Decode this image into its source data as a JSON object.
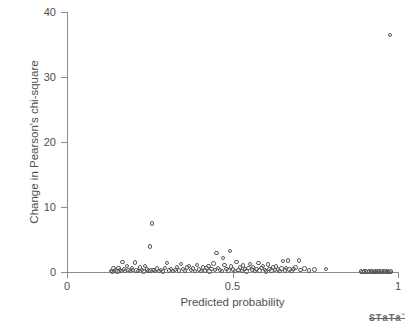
{
  "chart_data": {
    "type": "scatter",
    "title": "",
    "xlabel": "Predicted probability",
    "ylabel": "Change in Pearson's chi-square",
    "xlim": [
      0,
      1
    ],
    "ylim": [
      0,
      40
    ],
    "xticks": [
      "0",
      "0.5",
      "1"
    ],
    "xtick_values": [
      0,
      0.5,
      1
    ],
    "yticks": [
      "0",
      "10",
      "20",
      "30",
      "40"
    ],
    "ytick_values": [
      0,
      10,
      20,
      30,
      40
    ],
    "grid": false,
    "legend": null,
    "marker": "open-circle",
    "marker_color": "#5a5a5a",
    "series": [
      {
        "name": "observations",
        "points": [
          [
            0.132,
            0.18
          ],
          [
            0.137,
            0.1
          ],
          [
            0.141,
            0.55
          ],
          [
            0.146,
            0.22
          ],
          [
            0.152,
            0.08
          ],
          [
            0.156,
            0.62
          ],
          [
            0.16,
            0.3
          ],
          [
            0.163,
            0.12
          ],
          [
            0.168,
            1.55
          ],
          [
            0.172,
            0.45
          ],
          [
            0.176,
            0.2
          ],
          [
            0.181,
            0.9
          ],
          [
            0.186,
            0.28
          ],
          [
            0.191,
            0.12
          ],
          [
            0.196,
            0.58
          ],
          [
            0.2,
            0.35
          ],
          [
            0.205,
            1.45
          ],
          [
            0.21,
            0.22
          ],
          [
            0.215,
            0.15
          ],
          [
            0.22,
            0.72
          ],
          [
            0.226,
            0.3
          ],
          [
            0.231,
            0.1
          ],
          [
            0.236,
            0.95
          ],
          [
            0.241,
            0.4
          ],
          [
            0.246,
            0.18
          ],
          [
            0.25,
            3.95
          ],
          [
            0.252,
            0.25
          ],
          [
            0.256,
            7.45
          ],
          [
            0.261,
            0.32
          ],
          [
            0.266,
            0.12
          ],
          [
            0.272,
            0.55
          ],
          [
            0.278,
            0.2
          ],
          [
            0.284,
            0.28
          ],
          [
            0.29,
            0.1
          ],
          [
            0.296,
            0.62
          ],
          [
            0.302,
            1.35
          ],
          [
            0.308,
            0.22
          ],
          [
            0.314,
            0.48
          ],
          [
            0.32,
            0.18
          ],
          [
            0.326,
            0.35
          ],
          [
            0.332,
            0.8
          ],
          [
            0.338,
            0.25
          ],
          [
            0.344,
            1.2
          ],
          [
            0.35,
            0.42
          ],
          [
            0.356,
            0.15
          ],
          [
            0.362,
            0.68
          ],
          [
            0.368,
            0.95
          ],
          [
            0.374,
            0.3
          ],
          [
            0.38,
            0.55
          ],
          [
            0.386,
            0.2
          ],
          [
            0.392,
            1.05
          ],
          [
            0.398,
            0.38
          ],
          [
            0.404,
            0.12
          ],
          [
            0.41,
            0.72
          ],
          [
            0.416,
            0.25
          ],
          [
            0.422,
            0.6
          ],
          [
            0.428,
            0.9
          ],
          [
            0.43,
            0.05
          ],
          [
            0.436,
            0.45
          ],
          [
            0.442,
            1.3
          ],
          [
            0.448,
            0.28
          ],
          [
            0.452,
            2.95
          ],
          [
            0.456,
            0.65
          ],
          [
            0.462,
            0.35
          ],
          [
            0.468,
            0.18
          ],
          [
            0.472,
            2.15
          ],
          [
            0.476,
            1.1
          ],
          [
            0.482,
            0.5
          ],
          [
            0.488,
            0.22
          ],
          [
            0.492,
            3.2
          ],
          [
            0.496,
            0.82
          ],
          [
            0.502,
            0.4
          ],
          [
            0.508,
            0.12
          ],
          [
            0.512,
            1.55
          ],
          [
            0.518,
            0.3
          ],
          [
            0.522,
            0.68
          ],
          [
            0.528,
            0.2
          ],
          [
            0.532,
            1.0
          ],
          [
            0.538,
            0.45
          ],
          [
            0.542,
            0.08
          ],
          [
            0.548,
            0.58
          ],
          [
            0.552,
            1.25
          ],
          [
            0.558,
            0.32
          ],
          [
            0.562,
            0.75
          ],
          [
            0.568,
            0.15
          ],
          [
            0.572,
            0.5
          ],
          [
            0.578,
            1.42
          ],
          [
            0.582,
            0.26
          ],
          [
            0.588,
            0.62
          ],
          [
            0.592,
            0.95
          ],
          [
            0.598,
            0.35
          ],
          [
            0.602,
            0.1
          ],
          [
            0.608,
            1.18
          ],
          [
            0.612,
            0.48
          ],
          [
            0.618,
            0.22
          ],
          [
            0.622,
            0.7
          ],
          [
            0.628,
            0.3
          ],
          [
            0.632,
            0.85
          ],
          [
            0.638,
            0.4
          ],
          [
            0.642,
            0.14
          ],
          [
            0.648,
            0.55
          ],
          [
            0.652,
            1.72
          ],
          [
            0.658,
            0.25
          ],
          [
            0.662,
            0.62
          ],
          [
            0.668,
            1.8
          ],
          [
            0.672,
            0.38
          ],
          [
            0.678,
            0.18
          ],
          [
            0.684,
            0.45
          ],
          [
            0.69,
            0.7
          ],
          [
            0.7,
            1.75
          ],
          [
            0.706,
            0.3
          ],
          [
            0.718,
            0.52
          ],
          [
            0.732,
            0.24
          ],
          [
            0.748,
            0.4
          ],
          [
            0.782,
            0.45
          ],
          [
            0.888,
            0.06
          ],
          [
            0.893,
            0.04
          ],
          [
            0.898,
            0.08
          ],
          [
            0.903,
            0.05
          ],
          [
            0.908,
            0.03
          ],
          [
            0.913,
            0.07
          ],
          [
            0.918,
            0.05
          ],
          [
            0.922,
            0.1
          ],
          [
            0.926,
            0.04
          ],
          [
            0.93,
            0.06
          ],
          [
            0.934,
            0.03
          ],
          [
            0.938,
            0.09
          ],
          [
            0.942,
            0.05
          ],
          [
            0.946,
            0.04
          ],
          [
            0.95,
            0.07
          ],
          [
            0.954,
            0.03
          ],
          [
            0.958,
            0.06
          ],
          [
            0.962,
            0.05
          ],
          [
            0.966,
            0.04
          ],
          [
            0.97,
            0.08
          ],
          [
            0.974,
            0.03
          ],
          [
            0.978,
            0.05
          ],
          [
            0.975,
            36.5
          ]
        ]
      }
    ]
  },
  "footer": {
    "logo_text": "STaTa",
    "logo_mark": "™"
  }
}
